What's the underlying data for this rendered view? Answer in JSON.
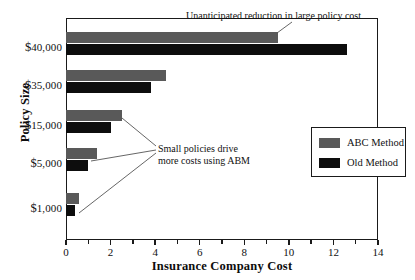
{
  "chart_data": {
    "type": "bar",
    "orientation": "horizontal",
    "title": "",
    "xlabel": "Insurance Company Cost",
    "ylabel": "Policy Size",
    "categories": [
      "$40,000",
      "$35,000",
      "$15,000",
      "$5,000",
      "$1,000"
    ],
    "series": [
      {
        "name": "ABC Method",
        "color": "#595959",
        "values": [
          9.5,
          4.5,
          2.5,
          1.4,
          0.6
        ]
      },
      {
        "name": "Old Method",
        "color": "#0d0d0d",
        "values": [
          12.6,
          3.8,
          2.0,
          1.0,
          0.4
        ]
      }
    ],
    "xlim": [
      0,
      14
    ],
    "xticks": [
      0,
      2,
      4,
      6,
      8,
      10,
      12,
      14
    ],
    "xtick_labels": [
      "0",
      "2",
      "4",
      "6",
      "8",
      "10",
      "12",
      "14"
    ],
    "xtick_minor_step": 1,
    "grid": false,
    "legend_position": "right-middle",
    "annotations": [
      {
        "id": "large-policy-note",
        "text": "Unanticipated reduction in large policy cost",
        "points_to": "ABC Method bar for $40,000"
      },
      {
        "id": "small-policy-note",
        "line1": "Small policies drive",
        "line2": "more costs using ABM",
        "points_to": "$15,000, $5,000 and $1,000 bars"
      }
    ]
  },
  "axis": {
    "x_title": "Insurance Company Cost",
    "y_title": "Policy Size",
    "y_categories": [
      {
        "currency": "$",
        "amount": "40,000"
      },
      {
        "currency": "$",
        "amount": "35,000"
      },
      {
        "currency": "$",
        "amount": "15,000"
      },
      {
        "currency": "$",
        "amount": "5,000"
      },
      {
        "currency": "$",
        "amount": "1,000"
      }
    ]
  },
  "legend": {
    "entries": [
      {
        "label": "ABC Method",
        "color": "#595959"
      },
      {
        "label": "Old Method",
        "color": "#0d0d0d"
      }
    ]
  },
  "annotations": {
    "top": "Unanticipated reduction in large policy cost",
    "small_line1": "Small policies drive",
    "small_line2": "more costs using ABM"
  },
  "colors": {
    "abc_method": "#595959",
    "old_method": "#0d0d0d",
    "frame": "#1a1a1a",
    "background": "#ffffff",
    "text": "#111111"
  }
}
